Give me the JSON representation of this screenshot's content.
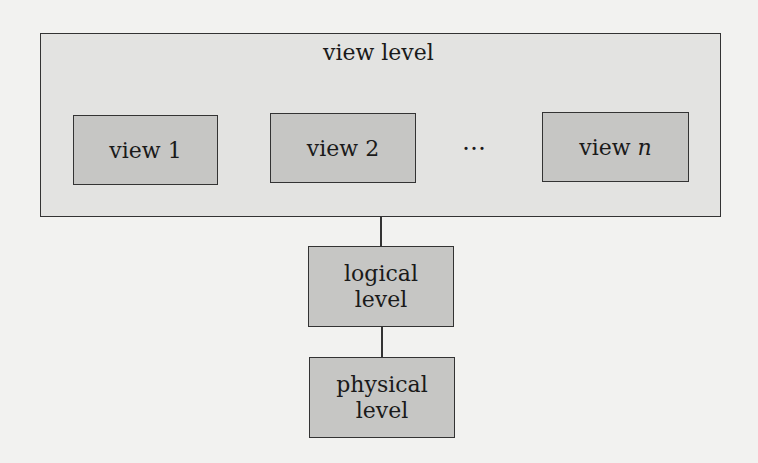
{
  "diagram": {
    "view_level": {
      "title": "view level",
      "views": [
        {
          "label": "view 1"
        },
        {
          "label": "view 2"
        },
        {
          "label_prefix": "view ",
          "label_var": "n"
        }
      ],
      "ellipsis": "…"
    },
    "logical_level": {
      "line1": "logical",
      "line2": "level"
    },
    "physical_level": {
      "line1": "physical",
      "line2": "level"
    },
    "colors": {
      "background": "#f2f2f0",
      "outer_fill": "#e3e3e1",
      "inner_fill": "#c6c6c4",
      "stroke": "#333333"
    }
  }
}
